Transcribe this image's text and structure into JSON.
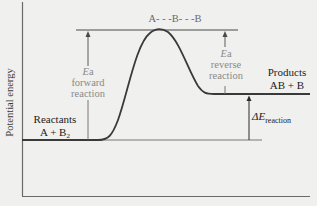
{
  "diagram": {
    "type": "reaction-energy-profile",
    "y_axis_label": "Potential energy",
    "transition_state": "A- - -B- - -B",
    "reactants": {
      "title": "Reactants",
      "formula_main": "A + B",
      "formula_sub": "2"
    },
    "products": {
      "title": "Products",
      "formula": "AB + B"
    },
    "ea_forward": {
      "symbol": "E",
      "symbol_suffix": "a",
      "line1": "forward",
      "line2": "reaction"
    },
    "ea_reverse": {
      "symbol": "E",
      "symbol_suffix": "a",
      "line1": "reverse",
      "line2": "reaction"
    },
    "delta_e": {
      "symbol": "ΔE",
      "subscript": "reaction"
    },
    "colors": {
      "background": "#f0f0ee",
      "axis": "#6a6a6a",
      "curve": "#3a3a3a",
      "annotation_text": "#8a8a88",
      "label_text": "#1c1c1c"
    },
    "levels": {
      "reactants_y": 140,
      "transition_y": 30,
      "products_y": 94
    }
  }
}
